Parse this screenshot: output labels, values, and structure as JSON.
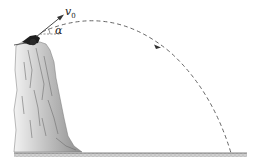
{
  "figure": {
    "type": "projectile-from-cliff",
    "labels": {
      "velocity_symbol": "v",
      "velocity_subscript": "0",
      "angle": "α"
    },
    "colors": {
      "line": "#333333",
      "trajectory": "#555555",
      "cliff_dark": "#8a8a8a",
      "cliff_light": "#e6e6e6",
      "ground": "#9a9a9a"
    }
  }
}
